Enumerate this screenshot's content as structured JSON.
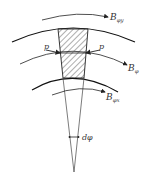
{
  "diagram": {
    "title": "",
    "labels": {
      "top_field": "B",
      "top_field_sub": "φy",
      "mid_field": "B",
      "mid_field_sub": "φ",
      "bottom_field": "B",
      "bottom_field_sub": "φx",
      "pressure_left": "p",
      "pressure_right": "p",
      "angle": "dφ"
    },
    "colors": {
      "stroke": "#222222",
      "text": "#333333",
      "background": "#ffffff"
    }
  }
}
